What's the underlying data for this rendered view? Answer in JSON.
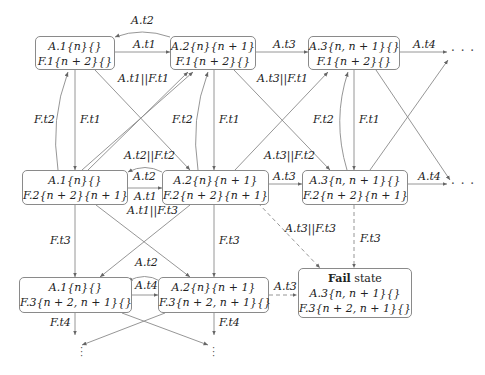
{
  "diagram": {
    "type": "state-transition-graph",
    "nodes": [
      {
        "id": "s11",
        "lines": [
          "A.1{n}{}",
          "F.1{n + 2}{}"
        ]
      },
      {
        "id": "s21",
        "lines": [
          "A.2{n}{n + 1}",
          "F.1{n + 2}{}"
        ]
      },
      {
        "id": "s31",
        "lines": [
          "A.3{n, n + 1}{}",
          "F.1{n + 2}{}"
        ]
      },
      {
        "id": "s12",
        "lines": [
          "A.1{n}{}",
          "F.2{n + 2}{n + 1}"
        ]
      },
      {
        "id": "s22",
        "lines": [
          "A.2{n}{n + 1}",
          "F.2{n + 2}{n + 1}"
        ]
      },
      {
        "id": "s32",
        "lines": [
          "A.3{n, n + 1}{}",
          "F.2{n + 2}{n + 1}"
        ]
      },
      {
        "id": "s13",
        "lines": [
          "A.1{n}{}",
          "F.3{n + 2, n + 1}{}"
        ]
      },
      {
        "id": "s23",
        "lines": [
          "A.2{n}{n + 1}",
          "F.3{n + 2, n + 1}{}"
        ]
      },
      {
        "id": "fail",
        "title_bold": "Fail",
        "title_rest": " state",
        "lines": [
          "A.3{n, n + 1}{}",
          "F.3{n + 2, n + 1}{}"
        ]
      }
    ],
    "edge_labels": {
      "top_back": "A.t2",
      "top_a1": "A.t1",
      "top_a3": "A.t3",
      "top_a4": "A.t4",
      "cross_11": "A.t1||F.t1",
      "cross_31": "A.t3||F.t1",
      "c1_ft2": "F.t2",
      "c1_ft1": "F.t1",
      "c2_ft2": "F.t2",
      "c2_ft1": "F.t1",
      "c3_ft2": "F.t2",
      "c3_ft1": "F.t1",
      "mid_cross_22": "A.t2||F.t2",
      "mid_back": "A.t2",
      "mid_a1": "A.t1",
      "mid_cross_13": "A.t1||F.t3",
      "mid_cross_32": "A.t3||F.t2",
      "mid_a3": "A.t3",
      "mid_a4": "A.t4",
      "fail_diag": "A.t3||F.t3",
      "fail_vert": "F.t3",
      "c1_ft3": "F.t3",
      "c2_ft3": "F.t3",
      "bot_back": "A.t2",
      "bot_a4": "A.t4",
      "bot_a3": "A.t3",
      "bot_ft4_left": "F.t4",
      "bot_ft4_right": "F.t4"
    },
    "continuation": "· · ·",
    "colors": {
      "edge": "#8a8a8a",
      "node_border": "#8a8a8a",
      "text": "#222222"
    }
  }
}
